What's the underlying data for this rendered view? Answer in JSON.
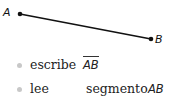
{
  "diagram": {
    "points": [
      {
        "label": "A",
        "x": 20,
        "y": 14
      },
      {
        "label": "B",
        "x": 151,
        "y": 39
      }
    ],
    "segment": {
      "from": "A",
      "to": "B",
      "color": "#111111"
    }
  },
  "list": {
    "items": [
      {
        "verb": "escribe",
        "notation": "AB",
        "overline": true
      },
      {
        "verb": "lee",
        "text": "segmento",
        "notation": "AB"
      }
    ]
  }
}
